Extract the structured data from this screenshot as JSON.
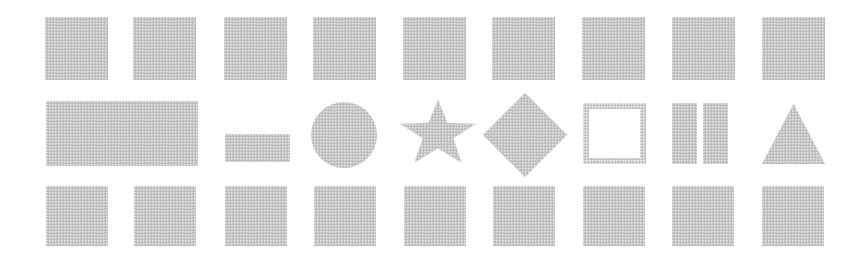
{
  "canvas": {
    "width": 868,
    "height": 260,
    "background_color": "#ffffff",
    "shape_fill_color": "#b9b9b9",
    "description": "Grid of gray halftone-textured geometric shapes arranged in three rows"
  },
  "rows": [
    {
      "name": "top-row",
      "label": "Top row of uniform squares",
      "count": 9,
      "shapes": [
        {
          "name": "square",
          "x": 45,
          "y": 17,
          "w": 63,
          "h": 63
        },
        {
          "name": "square",
          "x": 133,
          "y": 17,
          "w": 63,
          "h": 63
        },
        {
          "name": "square",
          "x": 224,
          "y": 17,
          "w": 63,
          "h": 63
        },
        {
          "name": "square",
          "x": 313,
          "y": 17,
          "w": 63,
          "h": 63
        },
        {
          "name": "square",
          "x": 403,
          "y": 17,
          "w": 63,
          "h": 63
        },
        {
          "name": "square",
          "x": 492,
          "y": 17,
          "w": 63,
          "h": 63
        },
        {
          "name": "square",
          "x": 582,
          "y": 17,
          "w": 63,
          "h": 63
        },
        {
          "name": "square",
          "x": 672,
          "y": 17,
          "w": 63,
          "h": 63
        },
        {
          "name": "square",
          "x": 762,
          "y": 17,
          "w": 63,
          "h": 63
        }
      ]
    },
    {
      "name": "middle-row",
      "label": "Middle row of varied shapes",
      "count": 9,
      "shapes": [
        {
          "name": "wide-rectangle",
          "x": 46,
          "y": 101,
          "w": 152,
          "h": 65
        },
        {
          "name": "small-rectangle",
          "x": 225,
          "y": 134,
          "w": 65,
          "h": 28
        },
        {
          "name": "circle",
          "x": 311,
          "y": 102,
          "w": 66,
          "h": 66
        },
        {
          "name": "five-point-star",
          "x": 400,
          "y": 100,
          "w": 76,
          "h": 66
        },
        {
          "name": "diamond",
          "x": 483,
          "y": 93,
          "w": 84,
          "h": 84
        },
        {
          "name": "hollow-square",
          "x": 583,
          "y": 103,
          "w": 63,
          "h": 61,
          "border": 6
        },
        {
          "name": "vertical-bar",
          "x": 672,
          "y": 103,
          "w": 25,
          "h": 61
        },
        {
          "name": "vertical-bar",
          "x": 703,
          "y": 103,
          "w": 25,
          "h": 61
        },
        {
          "name": "triangle",
          "x": 762,
          "y": 104,
          "w": 63,
          "h": 60
        }
      ]
    },
    {
      "name": "bottom-row",
      "label": "Bottom row of uniform squares",
      "count": 9,
      "shapes": [
        {
          "name": "square",
          "x": 46,
          "y": 186,
          "w": 62,
          "h": 60
        },
        {
          "name": "square",
          "x": 134,
          "y": 186,
          "w": 62,
          "h": 60
        },
        {
          "name": "square",
          "x": 225,
          "y": 186,
          "w": 62,
          "h": 60
        },
        {
          "name": "square",
          "x": 314,
          "y": 186,
          "w": 62,
          "h": 60
        },
        {
          "name": "square",
          "x": 404,
          "y": 186,
          "w": 62,
          "h": 60
        },
        {
          "name": "square",
          "x": 493,
          "y": 186,
          "w": 62,
          "h": 60
        },
        {
          "name": "square",
          "x": 583,
          "y": 186,
          "w": 62,
          "h": 60
        },
        {
          "name": "square",
          "x": 672,
          "y": 186,
          "w": 62,
          "h": 60
        },
        {
          "name": "square",
          "x": 762,
          "y": 186,
          "w": 62,
          "h": 60
        }
      ]
    }
  ]
}
